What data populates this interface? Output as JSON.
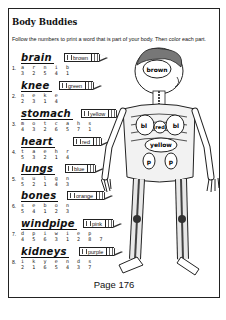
{
  "header": {
    "title": "Body Buddies"
  },
  "instructions": "Follow the numbers to print a word that is part of your body. Then color each part.",
  "items": [
    {
      "number": "1.",
      "word": "brain",
      "color": "brown",
      "letters": "a r n i b",
      "digits": "3 2 5 4 1"
    },
    {
      "number": "2.",
      "word": "knee",
      "color": "green",
      "letters": "n e k e",
      "digits": "2 3 1 4"
    },
    {
      "number": "3.",
      "word": "stomach",
      "color": "yellow",
      "letters": "m o t c a h s",
      "digits": "4 3 2 6 5 7 1"
    },
    {
      "number": "4.",
      "word": "heart",
      "color": "red",
      "letters": "t a e h r",
      "digits": "5 3 2 1 4"
    },
    {
      "number": "5.",
      "word": "lungs",
      "color": "blue",
      "letters": "s u l g n",
      "digits": "5 2 1 4 3"
    },
    {
      "number": "6.",
      "word": "bones",
      "color": "orange",
      "letters": "s e b o n",
      "digits": "5 4 1 2 3"
    },
    {
      "number": "7.",
      "word": "windpipe",
      "color": "pink",
      "letters": "d p i w i e p",
      "digits": "4 5 6 3 1 2 8 7"
    },
    {
      "number": "8.",
      "word": "kidneys",
      "color": "purple",
      "letters": "i k y e n d s",
      "digits": "2 1 6 5 4 3 7"
    }
  ],
  "figure_labels": {
    "brain": "brown",
    "lung_left": "bl",
    "heart": "red",
    "lung_right": "bl",
    "stomach": "yellow",
    "kidney_left": "p",
    "kidney_right": "p"
  },
  "footer": {
    "page": "Page 176"
  }
}
